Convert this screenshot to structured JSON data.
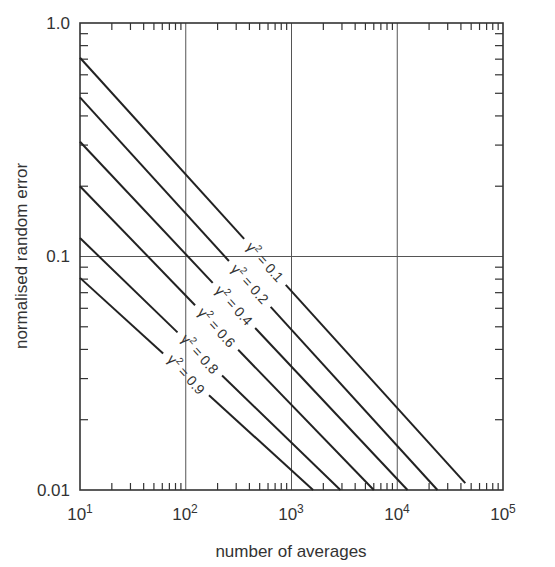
{
  "chart_data": {
    "type": "line",
    "title": "",
    "xlabel": "number of averages",
    "ylabel": "normalised random error",
    "xscale": "log",
    "yscale": "log",
    "xlim": [
      10,
      100000
    ],
    "ylim": [
      0.01,
      1.0
    ],
    "x_tick_labels": [
      "10^1",
      "10^2",
      "10^3",
      "10^4",
      "10^5"
    ],
    "x_tick_values": [
      10,
      100,
      1000,
      10000,
      100000
    ],
    "y_tick_labels": [
      "1.0",
      "0.1",
      "0.01"
    ],
    "y_tick_values": [
      1.0,
      0.1,
      0.01
    ],
    "grid": {
      "x_major": true,
      "y_major": true
    },
    "legend": "inline labels on curves",
    "series": [
      {
        "name": "γ² = 0.1",
        "label_base": "γ",
        "label_sup": "2",
        "label_rest": " = 0.1",
        "x": [
          10,
          44000
        ],
        "y": [
          0.71,
          0.0107
        ]
      },
      {
        "name": "γ² = 0.2",
        "label_base": "γ",
        "label_sup": "2",
        "label_rest": " = 0.2",
        "x": [
          10,
          24000
        ],
        "y": [
          0.48,
          0.0098
        ]
      },
      {
        "name": "γ² = 0.4",
        "label_base": "γ",
        "label_sup": "2",
        "label_rest": " = 0.4",
        "x": [
          10,
          12500
        ],
        "y": [
          0.31,
          0.0088
        ]
      },
      {
        "name": "γ² = 0.6",
        "label_base": "γ",
        "label_sup": "2",
        "label_rest": " = 0.6",
        "x": [
          10,
          6000
        ],
        "y": [
          0.2,
          0.0082
        ]
      },
      {
        "name": "γ² = 0.8",
        "label_base": "γ",
        "label_sup": "2",
        "label_rest": " = 0.8",
        "x": [
          10,
          2900
        ],
        "y": [
          0.12,
          0.007
        ]
      },
      {
        "name": "γ² = 0.9",
        "label_base": "γ",
        "label_sup": "2",
        "label_rest": " = 0.9",
        "x": [
          10,
          1600
        ],
        "y": [
          0.081,
          0.0064
        ]
      }
    ]
  },
  "axes": {
    "x_title": "number of averages",
    "y_title": "normalised random error",
    "x_ticks": [
      {
        "base": "10",
        "exp": "1"
      },
      {
        "base": "10",
        "exp": "2"
      },
      {
        "base": "10",
        "exp": "3"
      },
      {
        "base": "10",
        "exp": "4"
      },
      {
        "base": "10",
        "exp": "5"
      }
    ],
    "y_ticks": [
      "1.0",
      "0.1",
      "0.01"
    ]
  },
  "style": {
    "line_color": "#222222",
    "frame_color": "#333333",
    "grid_color": "#555555",
    "background": "#ffffff"
  }
}
